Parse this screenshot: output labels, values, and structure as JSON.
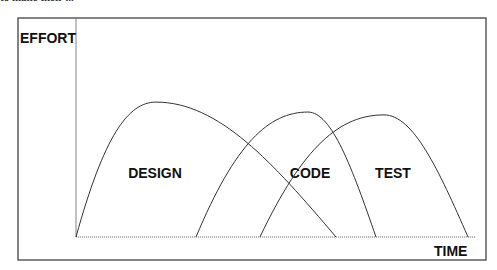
{
  "diagram": {
    "top_cut_text": "to make their ...",
    "y_axis_label": "EFFORT",
    "x_axis_label": "TIME",
    "phases": [
      {
        "name": "DESIGN",
        "start": 0.0,
        "peak": 0.2,
        "end": 0.65,
        "peak_height": 0.95
      },
      {
        "name": "CODE",
        "start": 0.3,
        "peak": 0.58,
        "end": 0.75,
        "peak_height": 0.88
      },
      {
        "name": "TEST",
        "start": 0.46,
        "peak": 0.77,
        "end": 0.98,
        "peak_height": 0.86
      }
    ],
    "line_color": "#333333"
  }
}
